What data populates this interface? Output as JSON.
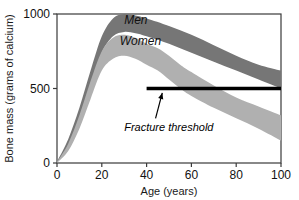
{
  "chart_data": {
    "type": "area",
    "title": "",
    "subtitle": "",
    "xlabel": "Age (years)",
    "ylabel": "Bone mass (grams of calcium)",
    "xlim": [
      0,
      100
    ],
    "ylim": [
      0,
      1000
    ],
    "xticks": [
      0,
      20,
      40,
      60,
      80,
      100
    ],
    "yticks": [
      0,
      500,
      1000
    ],
    "xtick_labels": [
      "0",
      "20",
      "40",
      "60",
      "80",
      "100"
    ],
    "ytick_labels": [
      "0",
      "500",
      "1000"
    ],
    "grid": false,
    "legend_position": "inline-labels",
    "series": [
      {
        "name": "Men",
        "color": "#767676",
        "label": "Men",
        "label_x": 30,
        "label_y": 930,
        "x": [
          0,
          5,
          10,
          15,
          20,
          25,
          30,
          35,
          40,
          50,
          60,
          70,
          80,
          90,
          100
        ],
        "upper": [
          10,
          160,
          370,
          620,
          850,
          970,
          1000,
          990,
          970,
          920,
          860,
          790,
          720,
          660,
          620
        ],
        "lower": [
          0,
          110,
          290,
          520,
          740,
          850,
          880,
          870,
          850,
          800,
          740,
          680,
          620,
          560,
          500
        ]
      },
      {
        "name": "Women",
        "color": "#b0b0b0",
        "label": "Women",
        "label_x": 28,
        "label_y": 790,
        "x": [
          0,
          5,
          10,
          15,
          20,
          25,
          30,
          35,
          40,
          45,
          50,
          55,
          60,
          70,
          80,
          90,
          100
        ],
        "upper": [
          8,
          130,
          320,
          550,
          750,
          840,
          860,
          840,
          800,
          770,
          720,
          660,
          610,
          520,
          440,
          380,
          320
        ],
        "lower": [
          0,
          80,
          230,
          430,
          620,
          700,
          720,
          700,
          660,
          620,
          560,
          500,
          450,
          370,
          300,
          230,
          150
        ]
      }
    ],
    "annotations": [
      {
        "name": "fracture-threshold",
        "label": "Fracture threshold",
        "type": "hline-with-arrow",
        "y": 500,
        "x_start": 40,
        "x_end": 100,
        "color": "#000000",
        "label_x": 30,
        "label_y": 215,
        "arrow_from_x": 44,
        "arrow_from_y": 300,
        "arrow_to_x": 47,
        "arrow_to_y": 470
      }
    ],
    "frame": {
      "visible": true,
      "color": "#3a3a3a"
    },
    "background": "#ffffff"
  }
}
